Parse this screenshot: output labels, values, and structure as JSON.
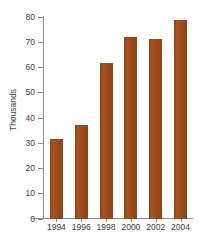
{
  "chart_data": {
    "type": "bar",
    "title": "",
    "subtitle": "",
    "xlabel": "",
    "ylabel": "Thousands",
    "categories": [
      "1994",
      "1996",
      "1998",
      "2000",
      "2002",
      "2004"
    ],
    "values": [
      31.8,
      37.3,
      61.8,
      72.2,
      71.2,
      78.8
    ],
    "ylim": [
      0,
      80
    ],
    "ytick_values": [
      0,
      10,
      20,
      30,
      40,
      50,
      60,
      70,
      80
    ],
    "ytick_labels": [
      "0",
      "10",
      "20",
      "30",
      "40",
      "50",
      "60",
      "70",
      "80"
    ],
    "grid": false,
    "legend": null,
    "legend_position": "none",
    "series": [
      {
        "name": "",
        "values": [
          31.8,
          37.3,
          61.8,
          72.2,
          71.2,
          78.8
        ],
        "color": "#9c4a18"
      }
    ],
    "bar_color": "#9c4a18",
    "axis_color": "#8d8d8d",
    "text_color": "#3d3d3d",
    "background": "#ffffff"
  }
}
